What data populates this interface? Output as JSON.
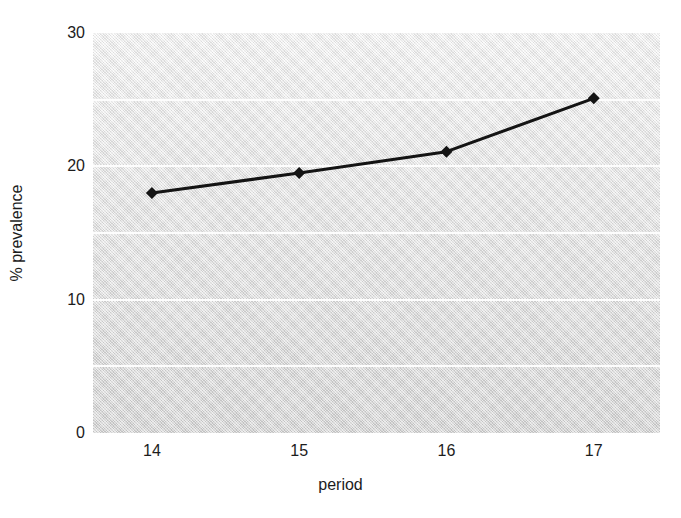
{
  "chart_data": {
    "type": "line",
    "title": "",
    "xlabel": "period",
    "ylabel": "% prevalence",
    "categories": [
      "14",
      "15",
      "16",
      "17"
    ],
    "x": [
      14,
      15,
      16,
      17
    ],
    "values": [
      18.0,
      19.5,
      21.1,
      25.1
    ],
    "series": [
      {
        "name": "% prevalence",
        "values": [
          18.0,
          19.5,
          21.1,
          25.1
        ],
        "line_color": "#141414",
        "marker": "diamond",
        "marker_color": "#141414"
      }
    ],
    "xlim": [
      13.6,
      17.45
    ],
    "ylim": [
      0,
      30
    ],
    "yticks": [
      0,
      10,
      20,
      30
    ],
    "ytick_labels": [
      "0",
      "10",
      "20",
      "30"
    ],
    "xtick_labels": [
      "14",
      "15",
      "16",
      "17"
    ],
    "gridlines_y": [
      5,
      10,
      15,
      20,
      25
    ],
    "grid": true,
    "grid_color": "#fdfdfd",
    "legend": false,
    "legend_position": "none",
    "plot_background": "gray-gradient",
    "figure_background": "#ffffff"
  }
}
